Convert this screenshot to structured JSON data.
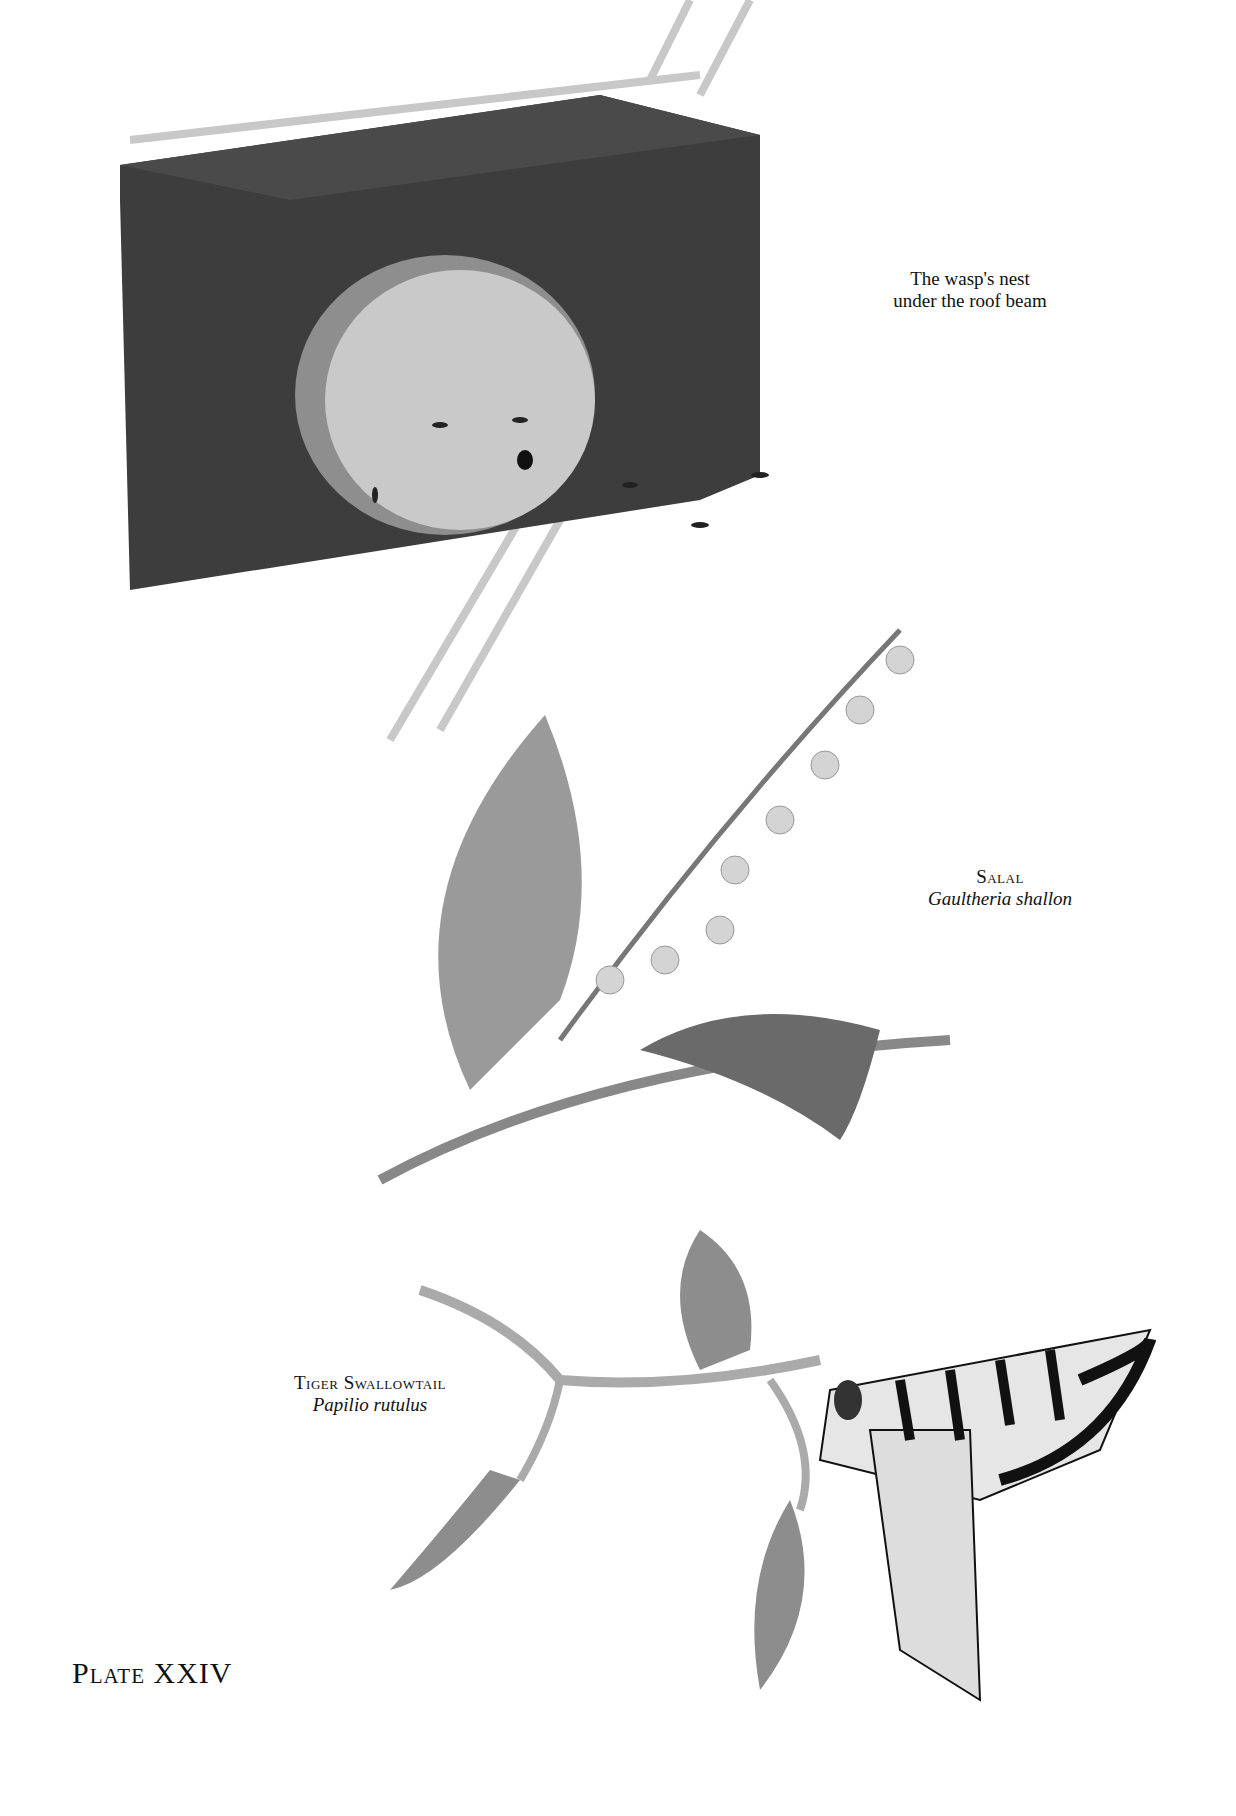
{
  "captions": {
    "wasp_nest": {
      "line1": "The wasp's nest",
      "line2": "under the roof beam"
    },
    "salal": {
      "common": "Salal",
      "latin": "Gaultheria shallon"
    },
    "tiger_swallowtail": {
      "common": "Tiger Swallowtail",
      "latin": "Papilio rutulus"
    }
  },
  "plate": {
    "label": "Plate XXIV"
  },
  "colors": {
    "paper": "#ffffff",
    "ink": "#111111",
    "wood": "#3a3a3a",
    "nest": "#bdbdbd",
    "leaf": "#8a8a8a"
  }
}
